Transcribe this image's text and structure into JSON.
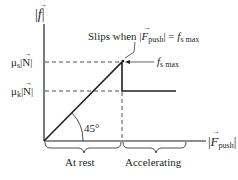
{
  "diagram": {
    "y_axis": {
      "label_symbol": "f",
      "label_bars": "|",
      "label_text": "|f|"
    },
    "x_axis": {
      "label_symbol": "F",
      "label_subscript": "push",
      "label_text": "|F_push|"
    },
    "levels": [
      {
        "prefix": "μ",
        "sub": "s",
        "suffix": "|N|",
        "text": "μs|N|"
      },
      {
        "prefix": "μ",
        "sub": "k",
        "suffix": "|N|",
        "text": "μk|N|"
      }
    ],
    "annotations": {
      "slips_prefix": "Slips when |",
      "slips_F": "F",
      "slips_push": "push",
      "slips_mid": "| = ",
      "slips_f": "f",
      "slips_sub": "s max",
      "peak_f": "f",
      "peak_sub": "s max",
      "angle": "45°"
    },
    "regions": [
      {
        "label": "At rest"
      },
      {
        "label": "Accelerating"
      }
    ],
    "colors": {
      "line": "#231f20",
      "background": "#ffffff"
    }
  }
}
